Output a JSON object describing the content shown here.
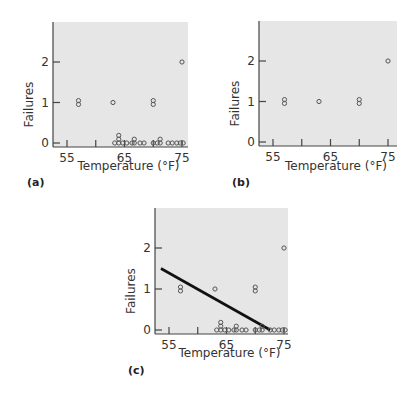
{
  "chart_data": [
    {
      "panel": "(a)",
      "type": "scatter",
      "xlabel": "Temperature (°F)",
      "ylabel": "Failures",
      "xticks": [
        55,
        60,
        65,
        70,
        75
      ],
      "xtick_labels": [
        "55",
        "",
        "65",
        "",
        "75"
      ],
      "yticks": [
        0,
        1,
        2
      ],
      "ytick_labels": [
        "0",
        "1",
        "2"
      ],
      "xlim": [
        53,
        76.5
      ],
      "ylim": [
        0,
        3
      ],
      "points": [
        {
          "x": 57,
          "y": 1
        },
        {
          "x": 57,
          "y": 1
        },
        {
          "x": 63,
          "y": 1
        },
        {
          "x": 70,
          "y": 1
        },
        {
          "x": 70,
          "y": 1
        },
        {
          "x": 75,
          "y": 2
        },
        {
          "x": 63.3,
          "y": 0
        },
        {
          "x": 64,
          "y": 0
        },
        {
          "x": 64,
          "y": 0
        },
        {
          "x": 64,
          "y": 0
        },
        {
          "x": 64.7,
          "y": 0
        },
        {
          "x": 65.4,
          "y": 0
        },
        {
          "x": 66.3,
          "y": 0
        },
        {
          "x": 66.7,
          "y": 0
        },
        {
          "x": 66.7,
          "y": 0
        },
        {
          "x": 67.7,
          "y": 0
        },
        {
          "x": 68.4,
          "y": 0
        },
        {
          "x": 70,
          "y": 0
        },
        {
          "x": 70.7,
          "y": 0
        },
        {
          "x": 71.2,
          "y": 0
        },
        {
          "x": 71.2,
          "y": 0
        },
        {
          "x": 72.6,
          "y": 0
        },
        {
          "x": 73.3,
          "y": 0
        },
        {
          "x": 74.1,
          "y": 0
        },
        {
          "x": 74.7,
          "y": 0
        },
        {
          "x": 75.2,
          "y": 0
        }
      ],
      "fit_line": null
    },
    {
      "panel": "(b)",
      "type": "scatter",
      "xlabel": "Temperature (°F)",
      "ylabel": "Failures",
      "xticks": [
        55,
        60,
        65,
        70,
        75
      ],
      "xtick_labels": [
        "55",
        "",
        "65",
        "",
        "75"
      ],
      "yticks": [
        0,
        1,
        2
      ],
      "ytick_labels": [
        "0",
        "1",
        "2"
      ],
      "xlim": [
        53,
        76.5
      ],
      "ylim": [
        0,
        3
      ],
      "points": [
        {
          "x": 57,
          "y": 1
        },
        {
          "x": 57,
          "y": 1
        },
        {
          "x": 63,
          "y": 1
        },
        {
          "x": 70,
          "y": 1
        },
        {
          "x": 70,
          "y": 1
        },
        {
          "x": 75,
          "y": 2
        }
      ],
      "fit_line": null
    },
    {
      "panel": "(c)",
      "type": "scatter",
      "xlabel": "Temperature (°F)",
      "ylabel": "Failures",
      "xticks": [
        55,
        60,
        65,
        70,
        75
      ],
      "xtick_labels": [
        "55",
        "",
        "65",
        "",
        "75"
      ],
      "yticks": [
        0,
        1,
        2
      ],
      "ytick_labels": [
        "0",
        "1",
        "2"
      ],
      "xlim": [
        53,
        76.5
      ],
      "ylim": [
        0,
        3
      ],
      "points": [
        {
          "x": 57,
          "y": 1
        },
        {
          "x": 57,
          "y": 1
        },
        {
          "x": 63,
          "y": 1
        },
        {
          "x": 70,
          "y": 1
        },
        {
          "x": 70,
          "y": 1
        },
        {
          "x": 75,
          "y": 2
        },
        {
          "x": 63.3,
          "y": 0
        },
        {
          "x": 64,
          "y": 0
        },
        {
          "x": 64,
          "y": 0
        },
        {
          "x": 64,
          "y": 0
        },
        {
          "x": 64.7,
          "y": 0
        },
        {
          "x": 65.4,
          "y": 0
        },
        {
          "x": 66.3,
          "y": 0
        },
        {
          "x": 66.7,
          "y": 0
        },
        {
          "x": 66.7,
          "y": 0
        },
        {
          "x": 67.7,
          "y": 0
        },
        {
          "x": 68.4,
          "y": 0
        },
        {
          "x": 70,
          "y": 0
        },
        {
          "x": 70.7,
          "y": 0
        },
        {
          "x": 71.2,
          "y": 0
        },
        {
          "x": 71.2,
          "y": 0
        },
        {
          "x": 72.6,
          "y": 0
        },
        {
          "x": 73.3,
          "y": 0
        },
        {
          "x": 74.1,
          "y": 0
        },
        {
          "x": 74.7,
          "y": 0
        },
        {
          "x": 75.2,
          "y": 0
        }
      ],
      "fit_line": {
        "x": [
          53.6,
          72.6
        ],
        "y": [
          1.5,
          0
        ]
      }
    }
  ],
  "colors": {
    "plot_background": "#e6e6e6",
    "axis": "#444444",
    "marker": "#555555",
    "fit_line": "#111111"
  }
}
